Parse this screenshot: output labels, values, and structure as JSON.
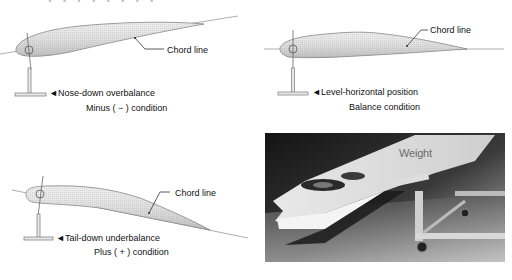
{
  "header": {
    "cropped_title": "· · · · ·  · · ·"
  },
  "diagrams": [
    {
      "id": "nose-down",
      "chord_label": "Chord line",
      "status_label": "◄Nose-down overbalance",
      "condition_label": "Minus ( − ) condition"
    },
    {
      "id": "level",
      "chord_label": "Chord line",
      "status_label": "◄Level-horizontal position",
      "condition_label": "Balance condition"
    },
    {
      "id": "tail-down",
      "chord_label": "Chord line",
      "status_label": "◄Tail-down underbalance",
      "condition_label": "Plus ( + ) condition"
    }
  ],
  "photo": {
    "label": "Weight"
  },
  "colors": {
    "airfoil_fill": "#e4e4e4",
    "airfoil_stroke": "#7a7a7a",
    "line": "#8c8c8c",
    "text": "#111111",
    "photo_bg": "#2a2a2a"
  }
}
